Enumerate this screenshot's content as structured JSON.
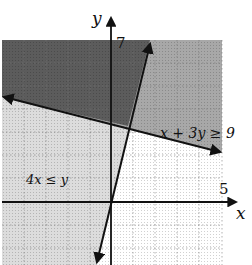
{
  "graph": {
    "axis_labels": {
      "x": "x",
      "y": "y"
    },
    "ticks": {
      "x_max_label": "5",
      "y_max_label": "7"
    },
    "inequalities": [
      {
        "label": "x + 3y ≥ 9",
        "boundary": "x + 3y = 9"
      },
      {
        "label": "4x ≤ y",
        "boundary": "4x = y"
      }
    ],
    "x_range": [
      -5,
      5
    ],
    "y_range": [
      -3,
      7
    ],
    "colors": {
      "both_region": "#5a5a5a",
      "single_region": "#9a9a9a",
      "light_region": "#dcdcdc",
      "grid": "#888888",
      "axis": "#111111"
    }
  }
}
